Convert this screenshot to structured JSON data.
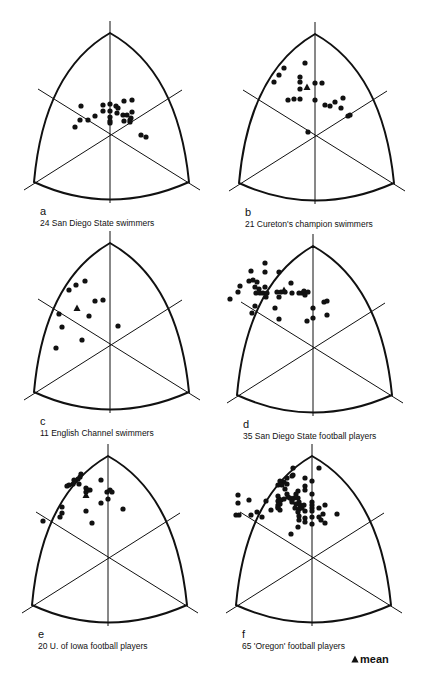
{
  "chart_data": [
    {
      "type": "scatter",
      "subtype": "somatochart",
      "letter": "a",
      "title": "24 San Diego State swimmers",
      "n": 24,
      "center": [
        110,
        133
      ],
      "points": [
        [
          -29,
          -27
        ],
        [
          -30,
          -13
        ],
        [
          -35,
          -6
        ],
        [
          -22,
          -13
        ],
        [
          -15,
          -17
        ],
        [
          -7,
          -22
        ],
        [
          -7,
          -28
        ],
        [
          0,
          -29
        ],
        [
          0,
          -22
        ],
        [
          0,
          -16
        ],
        [
          0,
          -12
        ],
        [
          0,
          -10
        ],
        [
          6,
          -27
        ],
        [
          8,
          -25
        ],
        [
          7,
          -20
        ],
        [
          13,
          -18
        ],
        [
          17,
          -18
        ],
        [
          14,
          -32
        ],
        [
          22,
          -33
        ],
        [
          22,
          -21
        ],
        [
          14,
          -12
        ],
        [
          20,
          -11
        ],
        [
          20,
          -13
        ],
        [
          21,
          -15
        ],
        [
          31,
          2
        ],
        [
          36,
          4
        ]
      ],
      "mean": null
    },
    {
      "type": "scatter",
      "subtype": "somatochart",
      "letter": "b",
      "title": "21 Cureton's champion swimmers",
      "n": 21,
      "center": [
        315,
        134
      ],
      "points": [
        [
          -10,
          -71
        ],
        [
          -31,
          -66
        ],
        [
          -36,
          -59
        ],
        [
          -41,
          -52
        ],
        [
          -15,
          -57
        ],
        [
          -15,
          -52
        ],
        [
          0,
          -51
        ],
        [
          7,
          -51
        ],
        [
          -15,
          -45
        ],
        [
          -27,
          -34
        ],
        [
          -21,
          -35
        ],
        [
          -15,
          -35
        ],
        [
          0,
          -34
        ],
        [
          10,
          -29
        ],
        [
          15,
          -28
        ],
        [
          20,
          -32
        ],
        [
          28,
          -36
        ],
        [
          26,
          -26
        ],
        [
          33,
          -18
        ],
        [
          35,
          -19
        ],
        [
          -7,
          -2
        ]
      ],
      "mean": [
        -8,
        -47
      ]
    },
    {
      "type": "scatter",
      "subtype": "somatochart",
      "letter": "c",
      "title": "11 English Channel swimmers",
      "n": 11,
      "center": [
        110,
        343
      ],
      "points": [
        [
          -25,
          -62
        ],
        [
          -34,
          -58
        ],
        [
          -41,
          -53
        ],
        [
          -15,
          -42
        ],
        [
          -7,
          -43
        ],
        [
          -21,
          -27
        ],
        [
          -51,
          -29
        ],
        [
          -48,
          -16
        ],
        [
          -28,
          -3
        ],
        [
          -54,
          5
        ],
        [
          8,
          -17
        ]
      ],
      "mean": [
        -33,
        -35
      ]
    },
    {
      "type": "scatter",
      "subtype": "somatochart",
      "letter": "d",
      "title": "35 San Diego State football players",
      "n": 35,
      "center": [
        313,
        346
      ],
      "points": [
        [
          -48,
          -83
        ],
        [
          -48,
          -74
        ],
        [
          -62,
          -75
        ],
        [
          -64,
          -65
        ],
        [
          -60,
          -66
        ],
        [
          -56,
          -64
        ],
        [
          -34,
          -74
        ],
        [
          -73,
          -60
        ],
        [
          -58,
          -59
        ],
        [
          -54,
          -57
        ],
        [
          -48,
          -59
        ],
        [
          -75,
          -54
        ],
        [
          -57,
          -53
        ],
        [
          -53,
          -53
        ],
        [
          -50,
          -53
        ],
        [
          -46,
          -53
        ],
        [
          -47,
          -49
        ],
        [
          -36,
          -54
        ],
        [
          -32,
          -54
        ],
        [
          -28,
          -54
        ],
        [
          -34,
          -49
        ],
        [
          -22,
          -63
        ],
        [
          -21,
          -53
        ],
        [
          -14,
          -53
        ],
        [
          -11,
          -53
        ],
        [
          -9,
          -55
        ],
        [
          -8,
          -51
        ],
        [
          -5,
          -54
        ],
        [
          -83,
          -47
        ],
        [
          -58,
          -40
        ],
        [
          -38,
          -38
        ],
        [
          -61,
          -33
        ],
        [
          -34,
          -27
        ],
        [
          -6,
          -25
        ],
        [
          0,
          -38
        ],
        [
          0,
          -28
        ],
        [
          11,
          -44
        ],
        [
          14,
          -45
        ],
        [
          14,
          -31
        ]
      ],
      "mean": [
        -29,
        -56
      ]
    },
    {
      "type": "scatter",
      "subtype": "somatochart",
      "letter": "e",
      "title": "20 U. of Iowa football players",
      "n": 20,
      "center": [
        108,
        556
      ],
      "points": [
        [
          -27,
          -82
        ],
        [
          -28,
          -79
        ],
        [
          -30,
          -77
        ],
        [
          -34,
          -76
        ],
        [
          -35,
          -72
        ],
        [
          -29,
          -72
        ],
        [
          -41,
          -70
        ],
        [
          -39,
          -71
        ],
        [
          -22,
          -68
        ],
        [
          -20,
          -66
        ],
        [
          -18,
          -66
        ],
        [
          -22,
          -64
        ],
        [
          -7,
          -76
        ],
        [
          -1,
          -64
        ],
        [
          2,
          -66
        ],
        [
          4,
          -64
        ],
        [
          0,
          -57
        ],
        [
          -7,
          -53
        ],
        [
          -46,
          -49
        ],
        [
          -46,
          -43
        ],
        [
          -48,
          -39
        ],
        [
          -65,
          -35
        ],
        [
          -22,
          -45
        ],
        [
          -16,
          -33
        ],
        [
          15,
          -47
        ]
      ],
      "mean": [
        -22,
        -61
      ]
    },
    {
      "type": "scatter",
      "subtype": "somatochart",
      "letter": "f",
      "title": "65 'Oregon' football players",
      "n": 65,
      "center": [
        312,
        556
      ],
      "points": [
        [
          -19,
          -88
        ],
        [
          -19,
          -81
        ],
        [
          -25,
          -78
        ],
        [
          -28,
          -74
        ],
        [
          -25,
          -72
        ],
        [
          -32,
          -75
        ],
        [
          -30,
          -71
        ],
        [
          -34,
          -71
        ],
        [
          -27,
          -67
        ],
        [
          -25,
          -62
        ],
        [
          -20,
          -80
        ],
        [
          -7,
          -78
        ],
        [
          -7,
          -70
        ],
        [
          -7,
          -66
        ],
        [
          -14,
          -65
        ],
        [
          -34,
          -60
        ],
        [
          -33,
          -57
        ],
        [
          -34,
          -55
        ],
        [
          -31,
          -56
        ],
        [
          -32,
          -52
        ],
        [
          -28,
          -57
        ],
        [
          -24,
          -59
        ],
        [
          -22,
          -58
        ],
        [
          -20,
          -56
        ],
        [
          -18,
          -58
        ],
        [
          -16,
          -62
        ],
        [
          -14,
          -58
        ],
        [
          -13,
          -54
        ],
        [
          -16,
          -52
        ],
        [
          -20,
          -54
        ],
        [
          -12,
          -51
        ],
        [
          -17,
          -48
        ],
        [
          -13,
          -47
        ],
        [
          -10,
          -48
        ],
        [
          -8,
          -51
        ],
        [
          -7,
          -45
        ],
        [
          -14,
          -44
        ],
        [
          -13,
          -40
        ],
        [
          -7,
          -38
        ],
        [
          -13,
          -36
        ],
        [
          -7,
          -34
        ],
        [
          0,
          -54
        ],
        [
          0,
          -51
        ],
        [
          0,
          -48
        ],
        [
          0,
          -45
        ],
        [
          0,
          -39
        ],
        [
          0,
          -32
        ],
        [
          0,
          -62
        ],
        [
          0,
          -75
        ],
        [
          -34,
          -51
        ],
        [
          -34,
          -49
        ],
        [
          -32,
          -46
        ],
        [
          -34,
          -48
        ],
        [
          -41,
          -46
        ],
        [
          -46,
          -55
        ],
        [
          -50,
          -39
        ],
        [
          -55,
          -44
        ],
        [
          -61,
          -41
        ],
        [
          -73,
          -41
        ],
        [
          -76,
          -41
        ],
        [
          -63,
          -56
        ],
        [
          -74,
          -61
        ],
        [
          -74,
          -53
        ],
        [
          7,
          -48
        ],
        [
          13,
          -51
        ],
        [
          11,
          -42
        ],
        [
          7,
          -39
        ],
        [
          9,
          -36
        ],
        [
          13,
          -33
        ],
        [
          25,
          -42
        ],
        [
          7,
          -88
        ],
        [
          -21,
          -22
        ],
        [
          -14,
          -29
        ]
      ],
      "mean": null
    }
  ],
  "legend": {
    "symbol": "triangle",
    "label": "mean"
  }
}
